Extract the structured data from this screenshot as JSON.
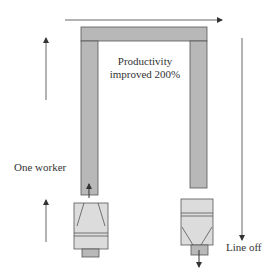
{
  "diagram": {
    "title_line1": "Productivity",
    "title_line2": "improved 200%",
    "left_label": "One worker",
    "right_label": "Line off",
    "colors": {
      "frame_fill": "#b8b8b8",
      "machine_fill": "#dcdcdc",
      "stroke": "#555555",
      "arrow": "#333333"
    }
  }
}
